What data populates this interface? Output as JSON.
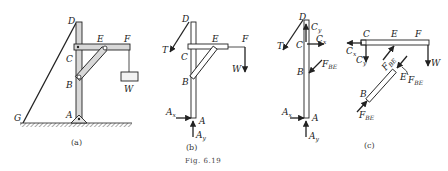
{
  "figure": {
    "caption": "Fig. 6.19",
    "subfigures": [
      {
        "id": "a",
        "caption": "(a)",
        "description": "Crane frame: vertical post DA pinned at A, horizontal beam CF, diagonal brace BE, cable DG to ground, weight W hanging from F",
        "labels": [
          "D",
          "E",
          "F",
          "C",
          "B",
          "W",
          "G",
          "A"
        ]
      },
      {
        "id": "b",
        "caption": "(b)",
        "description": "Free-body diagram of whole frame",
        "labels": [
          "D",
          "E",
          "F",
          "C",
          "B",
          "A"
        ],
        "forces": [
          "T",
          "W",
          "Ax",
          "Ay"
        ]
      },
      {
        "id": "c",
        "caption": "(c)",
        "description": "Free-body diagrams of individual members",
        "labels": [
          "D",
          "C",
          "B",
          "A",
          "C",
          "E",
          "F",
          "B",
          "E"
        ],
        "forces": [
          "T",
          "Cy",
          "Cx",
          "FBE",
          "Ax",
          "Ay",
          "Cx",
          "Cy",
          "FBE",
          "W",
          "FBE",
          "FBE"
        ]
      }
    ]
  },
  "text": {
    "a_D": "D",
    "a_E": "E",
    "a_F": "F",
    "a_C": "C",
    "a_B": "B",
    "a_W": "W",
    "a_G": "G",
    "a_A": "A",
    "a_cap": "(a)",
    "b_D": "D",
    "b_E": "E",
    "b_F": "F",
    "b_C": "C",
    "b_B": "B",
    "b_A": "A",
    "b_T": "T",
    "b_W": "W",
    "b_Ax": "A",
    "b_Ax_sub": "x",
    "b_Ay": "A",
    "b_Ay_sub": "y",
    "b_cap": "(b)",
    "fig_caption": "Fig. 6.19",
    "c1_D": "D",
    "c1_C": "C",
    "c1_B": "B",
    "c1_A": "A",
    "c1_T": "T",
    "c1_Cy": "C",
    "c1_Cy_sub": "y",
    "c1_Cx": "C",
    "c1_Cx_sub": "x",
    "c1_FBE": "F",
    "c1_FBE_sub": "BE",
    "c1_Ax": "A",
    "c1_Ax_sub": "x",
    "c1_Ay": "A",
    "c1_Ay_sub": "y",
    "c2_C": "C",
    "c2_E": "E",
    "c2_F": "F",
    "c2_Cx": "C",
    "c2_Cx_sub": "x",
    "c2_Cy": "C",
    "c2_Cy_sub": "y",
    "c2_FBE": "F",
    "c2_FBE_sub": "BE",
    "c2_W": "W",
    "c3_B": "B",
    "c3_E": "E",
    "c3_FBE1": "F",
    "c3_FBE1_sub": "BE",
    "c3_FBE2": "F",
    "c3_FBE2_sub": "BE",
    "c_cap": "(c)"
  }
}
